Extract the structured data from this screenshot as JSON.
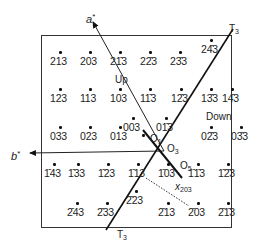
{
  "figure": {
    "axes": {
      "a_star": {
        "label": "a",
        "sup": "*"
      },
      "b_star": {
        "label": "b",
        "sup": "*"
      }
    },
    "twin_plane": {
      "label": "T",
      "sub": "3"
    },
    "regions": {
      "up": "Up",
      "down": "Down"
    },
    "origins": [
      {
        "label": "O",
        "sub": "1"
      },
      {
        "label": "O",
        "sub": "3"
      },
      {
        "label": "O",
        "sub": "5"
      }
    ],
    "vector_label": {
      "label": "x",
      "sub": "203"
    },
    "reflections": [
      {
        "h": "2",
        "k": "1",
        "l": "3",
        "x": 50,
        "y": 56
      },
      {
        "h": "2",
        "k": "0",
        "l": "3",
        "x": 80,
        "y": 56
      },
      {
        "h": "2",
        "k": "1̄",
        "l": "3",
        "x": 110,
        "y": 56
      },
      {
        "h": "2",
        "k": "2̄",
        "l": "3",
        "x": 140,
        "y": 56
      },
      {
        "h": "2",
        "k": "3̄",
        "l": "3",
        "x": 170,
        "y": 56
      },
      {
        "h": "2",
        "k": "4̄",
        "l": "3",
        "x": 201,
        "y": 44
      },
      {
        "h": "1",
        "k": "2",
        "l": "3",
        "x": 50,
        "y": 93
      },
      {
        "h": "1",
        "k": "1",
        "l": "3",
        "x": 80,
        "y": 93
      },
      {
        "h": "1",
        "k": "0",
        "l": "3",
        "x": 110,
        "y": 93
      },
      {
        "h": "1",
        "k": "1̄",
        "l": "3",
        "x": 140,
        "y": 93
      },
      {
        "h": "1",
        "k": "2̄",
        "l": "3",
        "x": 171,
        "y": 93
      },
      {
        "h": "1",
        "k": "3̄",
        "l": "3",
        "x": 201,
        "y": 93
      },
      {
        "h": "1",
        "k": "4̄",
        "l": "3",
        "x": 222,
        "y": 93
      },
      {
        "h": "0",
        "k": "0",
        "l": "3",
        "x": 123,
        "y": 122
      },
      {
        "h": "0",
        "k": "1̄",
        "l": "3",
        "x": 156,
        "y": 122
      },
      {
        "h": "0",
        "k": "3",
        "l": "3",
        "x": 50,
        "y": 131
      },
      {
        "h": "0",
        "k": "2",
        "l": "3",
        "x": 80,
        "y": 131
      },
      {
        "h": "0",
        "k": "1",
        "l": "3",
        "x": 110,
        "y": 131
      },
      {
        "h": "0",
        "k": "2̄",
        "l": "3",
        "x": 201,
        "y": 131
      },
      {
        "h": "0",
        "k": "3̄",
        "l": "3",
        "x": 231,
        "y": 131
      },
      {
        "h": "1̄",
        "k": "4",
        "l": "3",
        "x": 44,
        "y": 168
      },
      {
        "h": "1̄",
        "k": "3",
        "l": "3",
        "x": 68,
        "y": 168
      },
      {
        "h": "1̄",
        "k": "2",
        "l": "3",
        "x": 98,
        "y": 168
      },
      {
        "h": "1̄",
        "k": "1",
        "l": "3",
        "x": 128,
        "y": 168
      },
      {
        "h": "1̄",
        "k": "0",
        "l": "3",
        "x": 158,
        "y": 168
      },
      {
        "h": "1̄",
        "k": "1̄",
        "l": "3",
        "x": 188,
        "y": 168
      },
      {
        "h": "1̄",
        "k": "2̄",
        "l": "3",
        "x": 218,
        "y": 168
      },
      {
        "h": "2̄",
        "k": "2",
        "l": "3",
        "x": 126,
        "y": 195
      },
      {
        "h": "2̄",
        "k": "4",
        "l": "3",
        "x": 67,
        "y": 207
      },
      {
        "h": "2̄",
        "k": "3",
        "l": "3",
        "x": 97,
        "y": 207
      },
      {
        "h": "2̄",
        "k": "1",
        "l": "3",
        "x": 158,
        "y": 207
      },
      {
        "h": "2̄",
        "k": "0",
        "l": "3",
        "x": 188,
        "y": 207
      },
      {
        "h": "2̄",
        "k": "1̄",
        "l": "3",
        "x": 218,
        "y": 207
      }
    ]
  }
}
